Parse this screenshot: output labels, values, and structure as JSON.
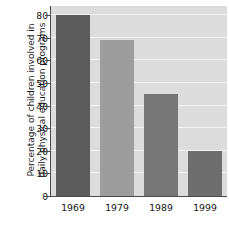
{
  "chart_data": {
    "type": "bar",
    "title": "",
    "subtitle": "",
    "xlabel": "",
    "ylabel": "Percentage of children involved in daily physical education programs",
    "ylabel_line1": "Percentage of children involved in",
    "ylabel_line2": "daily physical education programs",
    "categories": [
      "1969",
      "1979",
      "1989",
      "1999"
    ],
    "values": [
      80,
      69,
      45,
      20
    ],
    "series": [
      {
        "name": "Percentage of children involved in daily physical education programs",
        "values": [
          80,
          69,
          45,
          20
        ]
      }
    ],
    "ylim": [
      0,
      84
    ],
    "yticks": [
      0,
      10,
      20,
      30,
      40,
      50,
      60,
      70,
      80
    ],
    "ytick_labels": [
      "0",
      "10",
      "20",
      "30",
      "40",
      "50",
      "60",
      "70",
      "80"
    ],
    "grid": true,
    "grid_orientation": "horizontal",
    "legend": false,
    "legend_position": "none",
    "bar_colors": [
      "#5c5c5c",
      "#9d9d9d",
      "#767676",
      "#6e6e6e"
    ],
    "plot_background": "#dcdcdc",
    "gridline_color": "#f2f2f2",
    "axis_color": "#4a4a4a",
    "figure_background": "#ffffff",
    "annotations": []
  }
}
